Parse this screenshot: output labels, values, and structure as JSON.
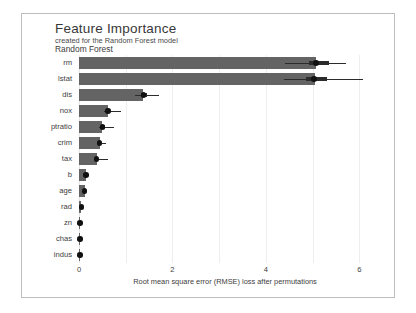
{
  "chart_data": {
    "type": "bar",
    "orientation": "horizontal",
    "title": "Feature Importance",
    "subtitle": "created for the Random Forest model",
    "panel_label": "Random Forest",
    "xlabel": "Root mean square error (RMSE) loss after permutations",
    "ylabel": "",
    "xlim": [
      0,
      6.25
    ],
    "xticks": [
      0,
      2,
      4,
      6
    ],
    "xticklabels": [
      "0",
      "2",
      "4",
      "6"
    ],
    "gridlines": [
      0,
      1,
      2,
      3,
      4,
      5,
      6
    ],
    "grid": true,
    "legend": false,
    "bar_color": "#646464",
    "box_color": "#2b2b2b",
    "categories": [
      "rm",
      "lstat",
      "dis",
      "nox",
      "ptratio",
      "crim",
      "tax",
      "b",
      "age",
      "rad",
      "zn",
      "chas",
      "indus"
    ],
    "values": [
      5.07,
      5.05,
      1.38,
      0.62,
      0.5,
      0.44,
      0.38,
      0.15,
      0.12,
      0.05,
      0.02,
      0.02,
      0.02
    ],
    "boxplots": [
      {
        "name": "rm",
        "whisker_low": 4.4,
        "q1": 4.92,
        "median": 5.07,
        "q3": 5.36,
        "whisker_high": 5.72
      },
      {
        "name": "lstat",
        "whisker_low": 4.38,
        "q1": 4.86,
        "median": 5.03,
        "q3": 5.3,
        "whisker_high": 6.08
      },
      {
        "name": "dis",
        "whisker_low": 1.2,
        "q1": 1.33,
        "median": 1.38,
        "q3": 1.46,
        "whisker_high": 1.72
      },
      {
        "name": "nox",
        "whisker_low": 0.53,
        "q1": 0.59,
        "median": 0.62,
        "q3": 0.66,
        "whisker_high": 0.9
      },
      {
        "name": "ptratio",
        "whisker_low": 0.42,
        "q1": 0.46,
        "median": 0.5,
        "q3": 0.56,
        "whisker_high": 0.75
      },
      {
        "name": "crim",
        "whisker_low": 0.38,
        "q1": 0.42,
        "median": 0.44,
        "q3": 0.48,
        "whisker_high": 0.58
      },
      {
        "name": "tax",
        "whisker_low": 0.32,
        "q1": 0.36,
        "median": 0.38,
        "q3": 0.41,
        "whisker_high": 0.62
      },
      {
        "name": "b",
        "whisker_low": 0.12,
        "q1": 0.14,
        "median": 0.15,
        "q3": 0.17,
        "whisker_high": 0.2
      },
      {
        "name": "age",
        "whisker_low": 0.09,
        "q1": 0.11,
        "median": 0.12,
        "q3": 0.14,
        "whisker_high": 0.17
      },
      {
        "name": "rad",
        "whisker_low": 0.03,
        "q1": 0.04,
        "median": 0.05,
        "q3": 0.06,
        "whisker_high": 0.07
      },
      {
        "name": "zn",
        "whisker_low": 0.01,
        "q1": 0.015,
        "median": 0.02,
        "q3": 0.025,
        "whisker_high": 0.03
      },
      {
        "name": "chas",
        "whisker_low": 0.01,
        "q1": 0.015,
        "median": 0.02,
        "q3": 0.025,
        "whisker_high": 0.03
      },
      {
        "name": "indus",
        "whisker_low": 0.0,
        "q1": 0.01,
        "median": 0.02,
        "q3": 0.035,
        "whisker_high": 0.05
      }
    ]
  }
}
